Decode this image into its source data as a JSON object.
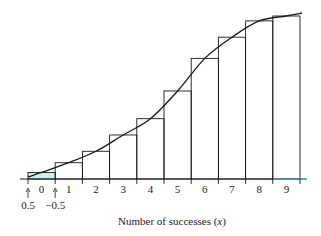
{
  "chart_data": {
    "type": "bar",
    "subtype": "cumulative histogram with smooth curve overlay",
    "title": "",
    "xlabel": "Number of successes (x)",
    "xlabel_parts": {
      "text": "Number of successes (",
      "var": "x",
      "close": ")"
    },
    "ylabel": "",
    "categories": [
      "0",
      "1",
      "2",
      "3",
      "4",
      "5",
      "6",
      "7",
      "8",
      "9"
    ],
    "values": [
      0.04,
      0.1,
      0.17,
      0.27,
      0.37,
      0.54,
      0.74,
      0.87,
      0.97,
      1.0
    ],
    "bar_edges": [
      -0.5,
      0.5,
      1.5,
      2.5,
      3.5,
      4.5,
      5.5,
      6.5,
      7.5,
      8.5,
      9.5
    ],
    "annotations": [
      {
        "text": "0.5",
        "arrow": "up",
        "at_edge_index": 0
      },
      {
        "text": "-0.5",
        "arrow": "up",
        "at_edge_index": 1
      }
    ],
    "ylim": [
      0,
      1.05
    ],
    "grid": false,
    "legend": null,
    "curve": "smooth S-shaped curve through bar tops"
  },
  "colors": {
    "line": "#1a1a1a",
    "axis": "#1a1a1a",
    "axis_highlight": "#3cc8d8",
    "bar0_fill": "#c8f0f4"
  }
}
